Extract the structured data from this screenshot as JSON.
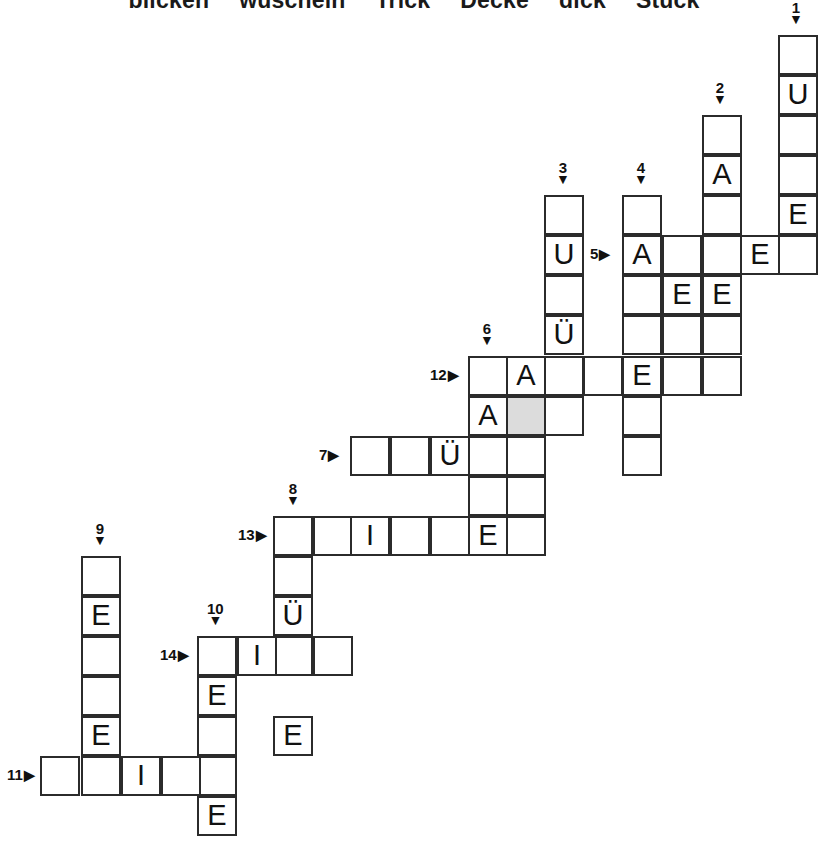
{
  "puzzle": {
    "title_words": [
      "blicken",
      "wuscheln",
      "Trick",
      "Decke",
      "dick",
      "Stück"
    ],
    "cell_size": 40,
    "shaded_color": "#dcdcdc",
    "ink_color": "#2b2b2b",
    "down_arrow": "▼",
    "right_arrow": "▶",
    "entries": [
      {
        "number": "1",
        "dir": "down",
        "col": 778,
        "row": 35,
        "length": 6,
        "letters": [
          "",
          "U",
          "",
          "",
          "E",
          ""
        ]
      },
      {
        "number": "2",
        "dir": "down",
        "col": 702,
        "row": 115,
        "length": 6,
        "letters": [
          "",
          "A",
          "",
          "",
          "E",
          ""
        ]
      },
      {
        "number": "3",
        "dir": "down",
        "col": 544,
        "row": 195,
        "length": 6,
        "letters": [
          "",
          "U",
          "",
          "Ü",
          "",
          ""
        ]
      },
      {
        "number": "4",
        "dir": "down",
        "col": 622,
        "row": 195,
        "length": 8,
        "letters": [
          "",
          "A",
          "",
          "",
          "E",
          "",
          "",
          ""
        ]
      },
      {
        "number": "5",
        "dir": "right",
        "col": 622,
        "row": 235,
        "length": 5,
        "letters": [
          "A",
          "",
          "",
          "E",
          ""
        ]
      },
      {
        "number": "6",
        "dir": "down",
        "col": 468,
        "row": 356,
        "length": 5,
        "letters": [
          "",
          "A",
          "",
          "",
          ""
        ]
      },
      {
        "number": "7",
        "dir": "right",
        "col": 350,
        "row": 436,
        "length": 5,
        "letters": [
          "",
          "",
          "Ü",
          "",
          ""
        ]
      },
      {
        "number": "8",
        "dir": "down",
        "col": 273,
        "row": 516,
        "length": 4,
        "letters": [
          "",
          "",
          "Ü",
          ""
        ]
      },
      {
        "number": "9",
        "dir": "down",
        "col": 81,
        "row": 556,
        "length": 5,
        "letters": [
          "",
          "E",
          "",
          "",
          "E"
        ]
      },
      {
        "number": "10",
        "dir": "down",
        "col": 197,
        "row": 636,
        "length": 5,
        "letters": [
          "",
          "E",
          "",
          "",
          "E"
        ]
      },
      {
        "number": "11",
        "dir": "right",
        "col": 40,
        "row": 756,
        "length": 5,
        "letters": [
          "",
          "",
          "I",
          "",
          ""
        ]
      },
      {
        "number": "12",
        "dir": "right",
        "col": 468,
        "row": 356,
        "length": 9,
        "letters": [
          "",
          "A",
          "",
          "",
          "E",
          "",
          "",
          "",
          ""
        ]
      },
      {
        "number": "13",
        "dir": "right",
        "col": 273,
        "row": 516,
        "length": 7,
        "letters": [
          "",
          "",
          "I",
          "",
          "",
          "E",
          ""
        ]
      },
      {
        "number": "14",
        "dir": "right",
        "col": 197,
        "row": 636,
        "length": 4,
        "letters": [
          "",
          "I",
          "",
          ""
        ]
      }
    ],
    "cells": [
      {
        "x": 778,
        "y": 35,
        "letter": ""
      },
      {
        "x": 778,
        "y": 75,
        "letter": "U"
      },
      {
        "x": 778,
        "y": 115,
        "letter": ""
      },
      {
        "x": 778,
        "y": 155,
        "letter": ""
      },
      {
        "x": 778,
        "y": 195,
        "letter": "E"
      },
      {
        "x": 778,
        "y": 235,
        "letter": ""
      },
      {
        "x": 702,
        "y": 115,
        "letter": ""
      },
      {
        "x": 702,
        "y": 155,
        "letter": "A"
      },
      {
        "x": 702,
        "y": 195,
        "letter": ""
      },
      {
        "x": 702,
        "y": 235,
        "letter": ""
      },
      {
        "x": 702,
        "y": 275,
        "letter": "E"
      },
      {
        "x": 702,
        "y": 315,
        "letter": ""
      },
      {
        "x": 544,
        "y": 195,
        "letter": ""
      },
      {
        "x": 544,
        "y": 235,
        "letter": "U"
      },
      {
        "x": 544,
        "y": 275,
        "letter": ""
      },
      {
        "x": 544,
        "y": 315,
        "letter": "Ü"
      },
      {
        "x": 544,
        "y": 356,
        "letter": ""
      },
      {
        "x": 544,
        "y": 396,
        "letter": ""
      },
      {
        "x": 622,
        "y": 195,
        "letter": ""
      },
      {
        "x": 622,
        "y": 235,
        "letter": "A"
      },
      {
        "x": 622,
        "y": 275,
        "letter": ""
      },
      {
        "x": 622,
        "y": 315,
        "letter": ""
      },
      {
        "x": 622,
        "y": 356,
        "letter": "E"
      },
      {
        "x": 622,
        "y": 396,
        "letter": ""
      },
      {
        "x": 622,
        "y": 436,
        "letter": ""
      },
      {
        "x": 662,
        "y": 235,
        "letter": ""
      },
      {
        "x": 740,
        "y": 235,
        "letter": "E"
      },
      {
        "x": 662,
        "y": 275,
        "letter": "E"
      },
      {
        "x": 662,
        "y": 315,
        "letter": ""
      },
      {
        "x": 468,
        "y": 356,
        "letter": ""
      },
      {
        "x": 506,
        "y": 356,
        "letter": "A"
      },
      {
        "x": 468,
        "y": 396,
        "letter": "A"
      },
      {
        "x": 506,
        "y": 396,
        "letter": "",
        "shaded": true
      },
      {
        "x": 468,
        "y": 436,
        "letter": ""
      },
      {
        "x": 506,
        "y": 436,
        "letter": ""
      },
      {
        "x": 468,
        "y": 476,
        "letter": ""
      },
      {
        "x": 506,
        "y": 476,
        "letter": ""
      },
      {
        "x": 583,
        "y": 356,
        "letter": ""
      },
      {
        "x": 662,
        "y": 356,
        "letter": ""
      },
      {
        "x": 702,
        "y": 356,
        "letter": ""
      },
      {
        "x": 350,
        "y": 436,
        "letter": ""
      },
      {
        "x": 390,
        "y": 436,
        "letter": ""
      },
      {
        "x": 430,
        "y": 436,
        "letter": "Ü"
      },
      {
        "x": 273,
        "y": 516,
        "letter": ""
      },
      {
        "x": 313,
        "y": 516,
        "letter": ""
      },
      {
        "x": 350,
        "y": 516,
        "letter": "I"
      },
      {
        "x": 390,
        "y": 516,
        "letter": ""
      },
      {
        "x": 430,
        "y": 516,
        "letter": ""
      },
      {
        "x": 468,
        "y": 516,
        "letter": "E"
      },
      {
        "x": 506,
        "y": 516,
        "letter": ""
      },
      {
        "x": 273,
        "y": 556,
        "letter": ""
      },
      {
        "x": 273,
        "y": 596,
        "letter": "Ü"
      },
      {
        "x": 273,
        "y": 636,
        "letter": ""
      },
      {
        "x": 273,
        "y": 716,
        "letter": "E"
      },
      {
        "x": 81,
        "y": 556,
        "letter": ""
      },
      {
        "x": 81,
        "y": 596,
        "letter": "E"
      },
      {
        "x": 81,
        "y": 636,
        "letter": ""
      },
      {
        "x": 81,
        "y": 676,
        "letter": ""
      },
      {
        "x": 81,
        "y": 716,
        "letter": "E"
      },
      {
        "x": 197,
        "y": 636,
        "letter": ""
      },
      {
        "x": 237,
        "y": 636,
        "letter": "I"
      },
      {
        "x": 313,
        "y": 636,
        "letter": ""
      },
      {
        "x": 197,
        "y": 676,
        "letter": "E"
      },
      {
        "x": 197,
        "y": 716,
        "letter": ""
      },
      {
        "x": 197,
        "y": 756,
        "letter": ""
      },
      {
        "x": 197,
        "y": 796,
        "letter": "E"
      },
      {
        "x": 40,
        "y": 756,
        "letter": ""
      },
      {
        "x": 81,
        "y": 756,
        "letter": ""
      },
      {
        "x": 121,
        "y": 756,
        "letter": "I"
      },
      {
        "x": 161,
        "y": 756,
        "letter": ""
      }
    ],
    "markers": [
      {
        "number": "1",
        "dir": "down",
        "x": 789,
        "y": 0
      },
      {
        "number": "2",
        "dir": "down",
        "x": 713,
        "y": 80
      },
      {
        "number": "3",
        "dir": "down",
        "x": 556,
        "y": 160
      },
      {
        "number": "4",
        "dir": "down",
        "x": 634,
        "y": 160
      },
      {
        "number": "5",
        "dir": "right",
        "x": 590,
        "y": 246
      },
      {
        "number": "6",
        "dir": "down",
        "x": 480,
        "y": 321
      },
      {
        "number": "7",
        "dir": "right",
        "x": 319,
        "y": 447
      },
      {
        "number": "8",
        "dir": "down",
        "x": 286,
        "y": 481
      },
      {
        "number": "9",
        "dir": "down",
        "x": 93,
        "y": 521
      },
      {
        "number": "10",
        "dir": "down",
        "x": 207,
        "y": 601
      },
      {
        "number": "11",
        "dir": "right",
        "x": 7,
        "y": 767
      },
      {
        "number": "12",
        "dir": "right",
        "x": 430,
        "y": 367
      },
      {
        "number": "13",
        "dir": "right",
        "x": 238,
        "y": 527
      },
      {
        "number": "14",
        "dir": "right",
        "x": 160,
        "y": 647
      }
    ]
  }
}
